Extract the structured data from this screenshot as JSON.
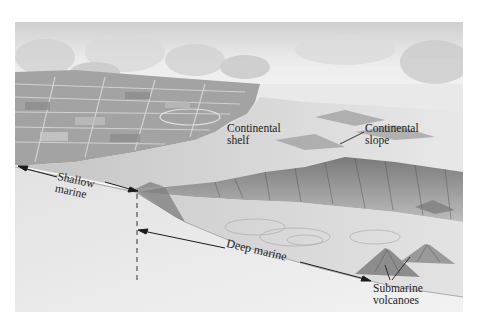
{
  "diagram": {
    "type": "illustration",
    "colors": {
      "background": "#ffffff",
      "sky": "#e6e6e6",
      "land": "#9a9a9a",
      "shelf": "#d0d0d0",
      "slope": "#6e6e6e",
      "deep_floor": "#dcdcdc",
      "cross_section_face": "#ebebeb",
      "text": "#222222",
      "arrow": "#1a1a1a"
    },
    "labels": {
      "continental_shelf": [
        "Continental",
        "shelf"
      ],
      "continental_slope": [
        "Continental",
        "slope"
      ],
      "shallow_marine": [
        "Shallow",
        "marine"
      ],
      "deep_marine": "Deep marine",
      "submarine_volcanoes": [
        "Submarine",
        "volcanoes"
      ]
    },
    "annotations": [
      {
        "name": "shallow-marine-extent",
        "kind": "double-arrow"
      },
      {
        "name": "deep-marine-extent",
        "kind": "double-arrow"
      },
      {
        "name": "shelf-break-marker",
        "kind": "dashed-line"
      },
      {
        "name": "slope-leader",
        "kind": "leader-line"
      },
      {
        "name": "volcano-leaders",
        "kind": "leader-lines",
        "count": 2
      }
    ]
  }
}
